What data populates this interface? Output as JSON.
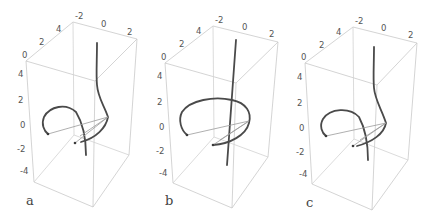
{
  "figure": {
    "panels": [
      {
        "label": "a",
        "x_ticks": [
          "-2",
          "0",
          "2"
        ],
        "y_ticks": [
          "0",
          "2",
          "4"
        ],
        "z_ticks": [
          "4",
          "2",
          "0",
          "-2",
          "-4"
        ]
      },
      {
        "label": "b",
        "x_ticks": [
          "-2",
          "0",
          "2"
        ],
        "y_ticks": [
          "0",
          "2",
          "4"
        ],
        "z_ticks": [
          "4",
          "2",
          "0",
          "-2",
          "-4"
        ]
      },
      {
        "label": "c",
        "x_ticks": [
          "-2",
          "0",
          "2"
        ],
        "y_ticks": [
          "0",
          "2",
          "4"
        ],
        "z_ticks": [
          "4",
          "2",
          "0",
          "-2",
          "-4"
        ]
      }
    ],
    "colors": {
      "box_edges": "#c9c9c9",
      "curve": "#4a4a4a",
      "chords": "#9a9a9a",
      "text": "#555555"
    }
  }
}
